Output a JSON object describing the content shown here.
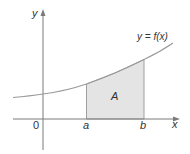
{
  "diagram": {
    "labels": {
      "y_axis": "y",
      "x_axis": "x",
      "origin": "0",
      "a": "a",
      "b": "b",
      "area": "A",
      "curve": "y = f(x)"
    },
    "colors": {
      "axis": "#7a7a7a",
      "curve": "#9a9a9a",
      "region_fill": "#e4e4e4",
      "region_edge": "#a0a0a0",
      "text": "#333333"
    }
  }
}
